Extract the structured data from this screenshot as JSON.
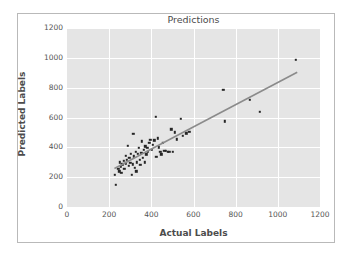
{
  "chart_data": {
    "type": "scatter",
    "title": "Predictions",
    "xlabel": "Actual Labels",
    "ylabel": "Predicted Labels",
    "xlim": [
      0,
      1200
    ],
    "ylim": [
      0,
      1200
    ],
    "xticks": [
      0,
      200,
      400,
      600,
      800,
      1000,
      1200
    ],
    "yticks": [
      0,
      200,
      400,
      600,
      800,
      1000,
      1200
    ],
    "grid": true,
    "legend": null,
    "point_color": "#262626",
    "line_color": "#8b8b8b",
    "plot_background": "#e5e5e5",
    "gridline_color": "#ffffff",
    "figure_background": "#ffffff",
    "series": [
      {
        "name": "predictions",
        "marker": "square",
        "points": [
          [
            228,
            215
          ],
          [
            232,
            150
          ],
          [
            243,
            258
          ],
          [
            248,
            238
          ],
          [
            250,
            300
          ],
          [
            255,
            268
          ],
          [
            258,
            230
          ],
          [
            262,
            285
          ],
          [
            268,
            310
          ],
          [
            272,
            258
          ],
          [
            278,
            345
          ],
          [
            280,
            292
          ],
          [
            283,
            318
          ],
          [
            288,
            412
          ],
          [
            292,
            275
          ],
          [
            296,
            330
          ],
          [
            300,
            298
          ],
          [
            304,
            355
          ],
          [
            308,
            215
          ],
          [
            312,
            285
          ],
          [
            315,
            490
          ],
          [
            318,
            340
          ],
          [
            322,
            262
          ],
          [
            325,
            372
          ],
          [
            328,
            238
          ],
          [
            332,
            300
          ],
          [
            336,
            355
          ],
          [
            340,
            398
          ],
          [
            344,
            318
          ],
          [
            348,
            282
          ],
          [
            352,
            362
          ],
          [
            356,
            440
          ],
          [
            360,
            330
          ],
          [
            364,
            385
          ],
          [
            368,
            300
          ],
          [
            372,
            408
          ],
          [
            376,
            352
          ],
          [
            380,
            398
          ],
          [
            384,
            370
          ],
          [
            390,
            430
          ],
          [
            396,
            452
          ],
          [
            402,
            385
          ],
          [
            408,
            418
          ],
          [
            414,
            448
          ],
          [
            420,
            605
          ],
          [
            424,
            338
          ],
          [
            430,
            460
          ],
          [
            436,
            400
          ],
          [
            442,
            372
          ],
          [
            448,
            352
          ],
          [
            455,
            430
          ],
          [
            462,
            375
          ],
          [
            470,
            378
          ],
          [
            478,
            368
          ],
          [
            486,
            372
          ],
          [
            494,
            520
          ],
          [
            502,
            370
          ],
          [
            512,
            500
          ],
          [
            522,
            455
          ],
          [
            540,
            590
          ],
          [
            548,
            478
          ],
          [
            566,
            495
          ],
          [
            580,
            505
          ],
          [
            742,
            785
          ],
          [
            748,
            575
          ],
          [
            866,
            720
          ],
          [
            915,
            640
          ],
          [
            1085,
            985
          ]
        ]
      }
    ],
    "fit_line": {
      "name": "regression-line",
      "x_start": 225,
      "y_start": 258,
      "x_end": 1092,
      "y_end": 903
    }
  }
}
